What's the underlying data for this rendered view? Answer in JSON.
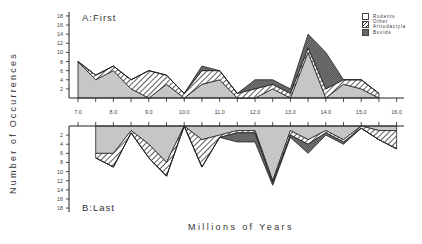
{
  "chart_data": [
    {
      "type": "area",
      "title": "A:First",
      "stacked": true,
      "x": [
        7.0,
        7.5,
        8.0,
        8.5,
        9.0,
        9.5,
        10.0,
        10.5,
        11.0,
        11.5,
        12.0,
        12.5,
        13.0,
        13.5,
        14.0,
        14.5,
        15.0,
        15.5
      ],
      "series": [
        {
          "name": "Rodents",
          "values": [
            8,
            4,
            6,
            2,
            0,
            3,
            0,
            3,
            4,
            0,
            0,
            2,
            0,
            10,
            0,
            3,
            2,
            0
          ]
        },
        {
          "name": "Other Artiodactyla",
          "values": [
            0,
            1,
            1,
            2,
            6,
            2,
            1,
            3,
            2,
            1,
            2,
            1,
            1,
            1,
            2,
            1,
            2,
            1
          ]
        },
        {
          "name": "Bovids",
          "values": [
            0,
            0,
            0,
            0,
            0,
            0,
            0,
            1,
            0,
            0,
            2,
            1,
            1,
            3,
            8,
            0,
            0,
            0
          ]
        }
      ],
      "xlabel": "Millions of Years",
      "ylabel": "Number of Occurrences",
      "yticks": [
        2,
        4,
        6,
        8,
        10,
        12,
        14,
        16,
        18
      ],
      "xticks": [
        "7.0",
        "8.0",
        "9.0",
        "10.0",
        "11.0",
        "12.0",
        "13.0",
        "14.0",
        "15.0",
        "16.0"
      ],
      "ylim": [
        0,
        18
      ]
    },
    {
      "type": "area",
      "title": "B:Last",
      "stacked": true,
      "inverted_y": true,
      "x": [
        7.5,
        8.0,
        8.5,
        9.0,
        9.5,
        10.0,
        10.5,
        11.0,
        11.5,
        12.0,
        12.5,
        13.0,
        13.5,
        14.0,
        14.5,
        15.0,
        15.5,
        16.0
      ],
      "series": [
        {
          "name": "Rodents",
          "values": [
            6,
            6,
            1,
            4,
            8,
            0,
            3,
            2,
            1,
            1,
            12,
            1,
            3,
            1,
            3,
            0,
            1,
            1
          ]
        },
        {
          "name": "Other Artiodactyla",
          "values": [
            1,
            3,
            0.5,
            3,
            3,
            0,
            6,
            0.5,
            0.5,
            0.5,
            0.5,
            1,
            1,
            0.5,
            0.5,
            0.5,
            2,
            4
          ]
        },
        {
          "name": "Bovids",
          "values": [
            0,
            0,
            0,
            0,
            0,
            0,
            0,
            0,
            2,
            2,
            0.5,
            0.5,
            2,
            0.5,
            0.5,
            0,
            0,
            0
          ]
        }
      ],
      "yticks": [
        2,
        4,
        6,
        8,
        10,
        12,
        14,
        16,
        18
      ],
      "ylim": [
        0,
        18
      ]
    }
  ],
  "labels": {
    "ylabel": "Number of Occurrences",
    "xlabel": "Millions of Years",
    "panelA": "A:First",
    "panelB": "B:Last"
  },
  "legend": [
    {
      "label": "Rodents",
      "pattern": "plain"
    },
    {
      "label": "Other Artiodactyla",
      "pattern": "diagonal-hatch"
    },
    {
      "label": "Bovids",
      "pattern": "cross-hatch"
    }
  ],
  "colors": {
    "rodents": "#c4c4c4",
    "axis": "#222222",
    "text": "#333333"
  }
}
